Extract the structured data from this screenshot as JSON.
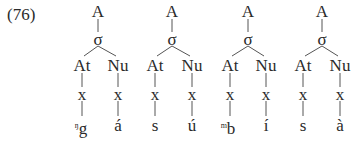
{
  "example_number": "(76)",
  "trees": [
    {
      "root": "A",
      "syllable": "σ",
      "onset_label": "At",
      "nucleus_label": "Nu",
      "timing_onset": "x",
      "timing_nucleus": "x",
      "onset_prenasal": "ŋ",
      "onset_segment": "g",
      "nucleus_segment": "á",
      "cx": 98,
      "at_x": 82,
      "nu_x": 118
    },
    {
      "root": "A",
      "syllable": "σ",
      "onset_label": "At",
      "nucleus_label": "Nu",
      "timing_onset": "x",
      "timing_nucleus": "x",
      "onset_prenasal": "",
      "onset_segment": "s",
      "nucleus_segment": "ú",
      "cx": 172,
      "at_x": 155,
      "nu_x": 192
    },
    {
      "root": "A",
      "syllable": "σ",
      "onset_label": "At",
      "nucleus_label": "Nu",
      "timing_onset": "x",
      "timing_nucleus": "x",
      "onset_prenasal": "m",
      "onset_segment": "b",
      "nucleus_segment": "í",
      "cx": 248,
      "at_x": 230,
      "nu_x": 266
    },
    {
      "root": "A",
      "syllable": "σ",
      "onset_label": "At",
      "nucleus_label": "Nu",
      "timing_onset": "x",
      "timing_nucleus": "x",
      "onset_prenasal": "",
      "onset_segment": "s",
      "nucleus_segment": "à",
      "cx": 322,
      "at_x": 303,
      "nu_x": 340
    }
  ]
}
